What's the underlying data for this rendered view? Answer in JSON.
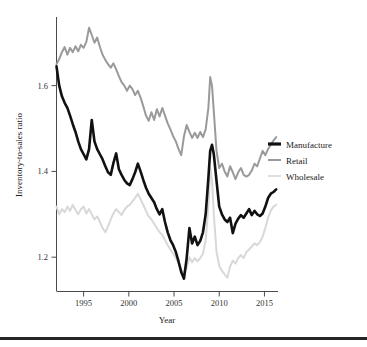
{
  "chart_data": {
    "type": "line",
    "title": "",
    "xlabel": "Year",
    "ylabel": "Inventory-to-sales ratio",
    "xlim": [
      1992.0,
      2016.5
    ],
    "ylim": [
      1.12,
      1.76
    ],
    "xticks": [
      1995,
      2000,
      2005,
      2010,
      2015
    ],
    "xtick_labels": [
      "1995",
      "2000",
      "2005",
      "2010",
      "2015"
    ],
    "yticks": [
      1.2,
      1.4,
      1.6
    ],
    "ytick_labels": [
      "1.2",
      "1.4",
      "1.6"
    ],
    "grid": false,
    "legend_position": "right",
    "colors": {
      "manufacture": "#111111",
      "retail": "#9a9a9a",
      "wholesale": "#d8d8d8"
    },
    "series": [
      {
        "name": "Manufacture",
        "color": "#111111",
        "x": [
          1992.0,
          1992.3,
          1992.6,
          1992.9,
          1993.2,
          1993.5,
          1993.8,
          1994.1,
          1994.4,
          1994.7,
          1995.0,
          1995.3,
          1995.6,
          1995.9,
          1996.2,
          1996.5,
          1996.8,
          1997.1,
          1997.4,
          1997.7,
          1998.0,
          1998.3,
          1998.6,
          1998.9,
          1999.2,
          1999.5,
          1999.8,
          2000.1,
          2000.4,
          2000.7,
          2001.0,
          2001.3,
          2001.6,
          2001.9,
          2002.2,
          2002.5,
          2002.8,
          2003.1,
          2003.4,
          2003.7,
          2004.0,
          2004.3,
          2004.6,
          2004.9,
          2005.2,
          2005.5,
          2005.8,
          2006.1,
          2006.4,
          2006.7,
          2007.0,
          2007.3,
          2007.6,
          2007.9,
          2008.2,
          2008.5,
          2008.8,
          2009.0,
          2009.2,
          2009.4,
          2009.7,
          2010.0,
          2010.3,
          2010.6,
          2010.9,
          2011.2,
          2011.5,
          2011.8,
          2012.1,
          2012.4,
          2012.7,
          2013.0,
          2013.3,
          2013.6,
          2013.9,
          2014.2,
          2014.5,
          2014.8,
          2015.1,
          2015.4,
          2015.7,
          2016.0,
          2016.3
        ],
        "y": [
          1.645,
          1.6,
          1.575,
          1.56,
          1.548,
          1.53,
          1.51,
          1.492,
          1.47,
          1.452,
          1.44,
          1.428,
          1.452,
          1.52,
          1.47,
          1.452,
          1.44,
          1.428,
          1.412,
          1.398,
          1.392,
          1.42,
          1.442,
          1.405,
          1.392,
          1.38,
          1.372,
          1.368,
          1.382,
          1.398,
          1.418,
          1.4,
          1.38,
          1.362,
          1.348,
          1.338,
          1.328,
          1.312,
          1.3,
          1.312,
          1.282,
          1.258,
          1.24,
          1.228,
          1.212,
          1.19,
          1.165,
          1.15,
          1.198,
          1.268,
          1.232,
          1.248,
          1.228,
          1.238,
          1.258,
          1.3,
          1.385,
          1.448,
          1.462,
          1.44,
          1.378,
          1.318,
          1.3,
          1.288,
          1.282,
          1.292,
          1.256,
          1.278,
          1.29,
          1.298,
          1.292,
          1.302,
          1.312,
          1.298,
          1.308,
          1.3,
          1.296,
          1.302,
          1.318,
          1.338,
          1.348,
          1.352,
          1.358
        ]
      },
      {
        "name": "Retail",
        "color": "#9a9a9a",
        "x": [
          1992.0,
          1992.3,
          1992.6,
          1992.9,
          1993.2,
          1993.5,
          1993.8,
          1994.1,
          1994.4,
          1994.7,
          1995.0,
          1995.3,
          1995.6,
          1995.9,
          1996.2,
          1996.5,
          1996.8,
          1997.1,
          1997.4,
          1997.7,
          1998.0,
          1998.3,
          1998.6,
          1998.9,
          1999.2,
          1999.5,
          1999.8,
          2000.1,
          2000.4,
          2000.7,
          2001.0,
          2001.3,
          2001.6,
          2001.9,
          2002.2,
          2002.5,
          2002.8,
          2003.1,
          2003.4,
          2003.7,
          2004.0,
          2004.3,
          2004.6,
          2004.9,
          2005.2,
          2005.5,
          2005.8,
          2006.1,
          2006.4,
          2006.7,
          2007.0,
          2007.3,
          2007.6,
          2007.9,
          2008.2,
          2008.5,
          2008.8,
          2009.0,
          2009.2,
          2009.4,
          2009.7,
          2010.0,
          2010.3,
          2010.6,
          2010.9,
          2011.2,
          2011.5,
          2011.8,
          2012.1,
          2012.4,
          2012.7,
          2013.0,
          2013.3,
          2013.6,
          2013.9,
          2014.2,
          2014.5,
          2014.8,
          2015.1,
          2015.4,
          2015.7,
          2016.0,
          2016.3
        ],
        "y": [
          1.65,
          1.662,
          1.678,
          1.69,
          1.672,
          1.688,
          1.678,
          1.692,
          1.68,
          1.695,
          1.688,
          1.702,
          1.735,
          1.718,
          1.7,
          1.712,
          1.69,
          1.672,
          1.66,
          1.65,
          1.642,
          1.652,
          1.638,
          1.622,
          1.608,
          1.6,
          1.588,
          1.6,
          1.592,
          1.578,
          1.588,
          1.572,
          1.552,
          1.53,
          1.518,
          1.538,
          1.52,
          1.545,
          1.528,
          1.548,
          1.53,
          1.512,
          1.498,
          1.482,
          1.47,
          1.452,
          1.438,
          1.482,
          1.508,
          1.492,
          1.478,
          1.49,
          1.478,
          1.492,
          1.48,
          1.498,
          1.548,
          1.62,
          1.6,
          1.54,
          1.448,
          1.408,
          1.418,
          1.4,
          1.388,
          1.412,
          1.398,
          1.382,
          1.398,
          1.408,
          1.392,
          1.388,
          1.392,
          1.402,
          1.418,
          1.412,
          1.43,
          1.448,
          1.438,
          1.452,
          1.462,
          1.472,
          1.48
        ]
      },
      {
        "name": "Wholesale",
        "color": "#d8d8d8",
        "x": [
          1992.0,
          1992.3,
          1992.6,
          1992.9,
          1993.2,
          1993.5,
          1993.8,
          1994.1,
          1994.4,
          1994.7,
          1995.0,
          1995.3,
          1995.6,
          1995.9,
          1996.2,
          1996.5,
          1996.8,
          1997.1,
          1997.4,
          1997.7,
          1998.0,
          1998.3,
          1998.6,
          1998.9,
          1999.2,
          1999.5,
          1999.8,
          2000.1,
          2000.4,
          2000.7,
          2001.0,
          2001.3,
          2001.6,
          2001.9,
          2002.2,
          2002.5,
          2002.8,
          2003.1,
          2003.4,
          2003.7,
          2004.0,
          2004.3,
          2004.6,
          2004.9,
          2005.2,
          2005.5,
          2005.8,
          2006.1,
          2006.4,
          2006.7,
          2007.0,
          2007.3,
          2007.6,
          2007.9,
          2008.2,
          2008.5,
          2008.8,
          2009.0,
          2009.2,
          2009.4,
          2009.7,
          2010.0,
          2010.3,
          2010.6,
          2010.9,
          2011.2,
          2011.5,
          2011.8,
          2012.1,
          2012.4,
          2012.7,
          2013.0,
          2013.3,
          2013.6,
          2013.9,
          2014.2,
          2014.5,
          2014.8,
          2015.1,
          2015.4,
          2015.7,
          2016.0,
          2016.3
        ],
        "y": [
          1.318,
          1.3,
          1.312,
          1.305,
          1.318,
          1.308,
          1.322,
          1.31,
          1.3,
          1.312,
          1.318,
          1.302,
          1.312,
          1.3,
          1.288,
          1.295,
          1.282,
          1.268,
          1.258,
          1.272,
          1.288,
          1.302,
          1.312,
          1.305,
          1.298,
          1.31,
          1.318,
          1.322,
          1.33,
          1.338,
          1.348,
          1.335,
          1.322,
          1.308,
          1.295,
          1.288,
          1.278,
          1.268,
          1.258,
          1.252,
          1.24,
          1.228,
          1.218,
          1.208,
          1.198,
          1.185,
          1.172,
          1.162,
          1.175,
          1.2,
          1.188,
          1.198,
          1.19,
          1.198,
          1.208,
          1.24,
          1.318,
          1.408,
          1.38,
          1.3,
          1.212,
          1.18,
          1.168,
          1.16,
          1.152,
          1.178,
          1.192,
          1.185,
          1.198,
          1.205,
          1.198,
          1.212,
          1.218,
          1.225,
          1.232,
          1.228,
          1.235,
          1.248,
          1.268,
          1.292,
          1.308,
          1.318,
          1.322
        ]
      }
    ]
  },
  "legend": {
    "items": [
      {
        "label": "Manufacture",
        "color": "#111111",
        "swatch_width": 3.2
      },
      {
        "label": "Retail",
        "color": "#9a9a9a",
        "swatch_width": 2.0
      },
      {
        "label": "Wholesale",
        "color": "#d8d8d8",
        "swatch_width": 1.6
      }
    ]
  },
  "figure": {
    "background": "#ffffff",
    "footer_rule_color": "#262626"
  }
}
